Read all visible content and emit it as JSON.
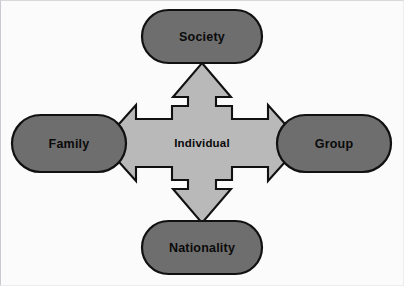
{
  "diagram": {
    "type": "radial-four-way-arrow",
    "center": {
      "id": "individual",
      "label": "Individual",
      "shape": "four-way-arrow",
      "fill": "#b9b9b9",
      "stroke": "#111111"
    },
    "nodes": [
      {
        "id": "society",
        "label": "Society",
        "position": "top",
        "shape": "rounded-pill",
        "fill": "#6e6e6e",
        "stroke": "#111111"
      },
      {
        "id": "family",
        "label": "Family",
        "position": "left",
        "shape": "rounded-pill",
        "fill": "#6e6e6e",
        "stroke": "#111111"
      },
      {
        "id": "group",
        "label": "Group",
        "position": "right",
        "shape": "rounded-pill",
        "fill": "#6e6e6e",
        "stroke": "#111111"
      },
      {
        "id": "nationality",
        "label": "Nationality",
        "position": "bottom",
        "shape": "rounded-pill",
        "fill": "#6e6e6e",
        "stroke": "#111111"
      }
    ],
    "arrows": [
      {
        "id": "arrow-up",
        "from": "individual",
        "to": "society",
        "direction": "up"
      },
      {
        "id": "arrow-left",
        "from": "individual",
        "to": "family",
        "direction": "left"
      },
      {
        "id": "arrow-right",
        "from": "individual",
        "to": "group",
        "direction": "right"
      },
      {
        "id": "arrow-down",
        "from": "individual",
        "to": "nationality",
        "direction": "down"
      }
    ],
    "colors": {
      "background": "#fbfbfb",
      "node_fill": "#6e6e6e",
      "center_fill": "#b9b9b9",
      "stroke": "#111111",
      "text": "#0a0a0a"
    }
  }
}
